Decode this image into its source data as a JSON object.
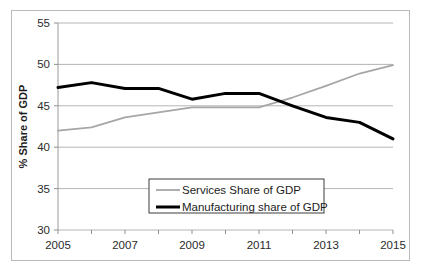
{
  "chart_data": {
    "type": "line",
    "title": "",
    "xlabel": "",
    "ylabel": "% Share of GDP",
    "xlim": [
      2005,
      2015
    ],
    "ylim": [
      30,
      55
    ],
    "grid": true,
    "legend_position": "center-bottom",
    "x": [
      2005,
      2006,
      2007,
      2008,
      2009,
      2010,
      2011,
      2012,
      2013,
      2014,
      2015
    ],
    "xtick_labels": [
      "2005",
      "2007",
      "2009",
      "2011",
      "2013",
      "2015"
    ],
    "xtick_values": [
      2005,
      2007,
      2009,
      2011,
      2013,
      2015
    ],
    "ytick_labels": [
      "30",
      "35",
      "40",
      "45",
      "50",
      "55"
    ],
    "ytick_values": [
      30,
      35,
      40,
      45,
      50,
      55
    ],
    "series": [
      {
        "name": "Services Share of GDP",
        "color": "#a6a6a6",
        "width": 1.8,
        "values": [
          42.0,
          42.4,
          43.6,
          44.2,
          44.8,
          44.8,
          44.8,
          46.0,
          47.4,
          48.9,
          49.9
        ]
      },
      {
        "name": "Manufacturing share of GDP",
        "color": "#000000",
        "width": 3.0,
        "values": [
          47.2,
          47.8,
          47.1,
          47.1,
          45.8,
          46.5,
          46.5,
          45.0,
          43.6,
          43.0,
          41.0
        ]
      }
    ]
  },
  "axis": {
    "y_title": "% Share of GDP"
  },
  "legend": {
    "entries": [
      {
        "label": "Services Share of GDP"
      },
      {
        "label": "Manufacturing share of GDP"
      }
    ]
  }
}
